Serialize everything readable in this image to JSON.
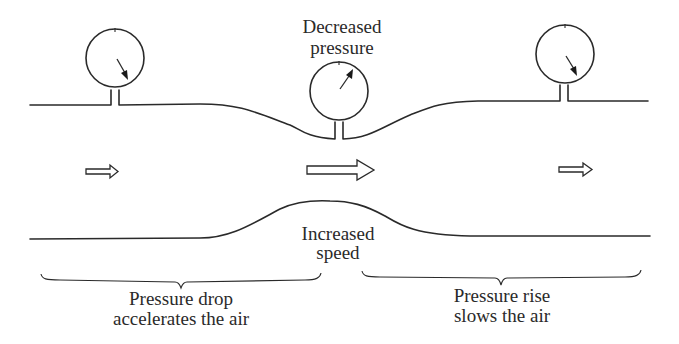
{
  "diagram": {
    "labels": {
      "gauge_center_line1": "Decreased",
      "gauge_center_line2": "pressure",
      "throat_line1": "Increased",
      "throat_line2": "speed",
      "left_brace_line1": "Pressure drop",
      "left_brace_line2": "accelerates the air",
      "right_brace_line1": "Pressure rise",
      "right_brace_line2": "slows the air"
    },
    "gauges": [
      {
        "id": "left",
        "position": "wide section inlet",
        "needle": "higher pressure (pointing down-right)"
      },
      {
        "id": "center",
        "position": "throat",
        "needle": "decreased pressure (pointing up-right)"
      },
      {
        "id": "right",
        "position": "wide section outlet",
        "needle": "higher pressure (pointing down-right)"
      }
    ],
    "flow_arrows": [
      {
        "id": "left",
        "size": "small",
        "meaning": "slow flow"
      },
      {
        "id": "center",
        "size": "large",
        "meaning": "fast flow"
      },
      {
        "id": "right",
        "size": "small",
        "meaning": "slow flow"
      }
    ],
    "colors": {
      "line": "#2a2a2a",
      "background": "#ffffff"
    }
  }
}
